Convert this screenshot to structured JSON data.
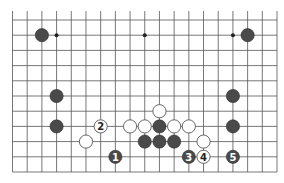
{
  "diagram": {
    "type": "go-board-fragment",
    "columns": 19,
    "rows_shown": 11,
    "bottom_edge": true,
    "colors": {
      "black_stone": "#4a4a4a",
      "white_stone": "#ffffff",
      "line": "#555555"
    },
    "hoshi": [
      {
        "col": 3,
        "row": 1
      },
      {
        "col": 9,
        "row": 1
      },
      {
        "col": 15,
        "row": 1
      }
    ],
    "stones": [
      {
        "color": "black",
        "col": 2,
        "row": 1,
        "label": ""
      },
      {
        "color": "black",
        "col": 16,
        "row": 1,
        "label": ""
      },
      {
        "color": "black",
        "col": 3,
        "row": 5,
        "label": ""
      },
      {
        "color": "black",
        "col": 3,
        "row": 7,
        "label": ""
      },
      {
        "color": "black",
        "col": 15,
        "row": 5,
        "label": ""
      },
      {
        "color": "black",
        "col": 15,
        "row": 7,
        "label": ""
      },
      {
        "color": "white",
        "col": 10,
        "row": 6,
        "label": ""
      },
      {
        "color": "white",
        "col": 6,
        "row": 7,
        "label": "2"
      },
      {
        "color": "white",
        "col": 8,
        "row": 7,
        "label": ""
      },
      {
        "color": "white",
        "col": 9,
        "row": 7,
        "label": ""
      },
      {
        "color": "black",
        "col": 10,
        "row": 7,
        "label": ""
      },
      {
        "color": "white",
        "col": 11,
        "row": 7,
        "label": ""
      },
      {
        "color": "white",
        "col": 12,
        "row": 7,
        "label": ""
      },
      {
        "color": "white",
        "col": 5,
        "row": 8,
        "label": ""
      },
      {
        "color": "black",
        "col": 9,
        "row": 8,
        "label": ""
      },
      {
        "color": "black",
        "col": 10,
        "row": 8,
        "label": ""
      },
      {
        "color": "black",
        "col": 11,
        "row": 8,
        "label": ""
      },
      {
        "color": "white",
        "col": 13,
        "row": 8,
        "label": ""
      },
      {
        "color": "black",
        "col": 7,
        "row": 9,
        "label": "1"
      },
      {
        "color": "black",
        "col": 12,
        "row": 9,
        "label": "3"
      },
      {
        "color": "white",
        "col": 13,
        "row": 9,
        "label": "4"
      },
      {
        "color": "black",
        "col": 15,
        "row": 9,
        "label": "5"
      }
    ],
    "move_labels": [
      "1",
      "2",
      "3",
      "4",
      "5"
    ]
  }
}
